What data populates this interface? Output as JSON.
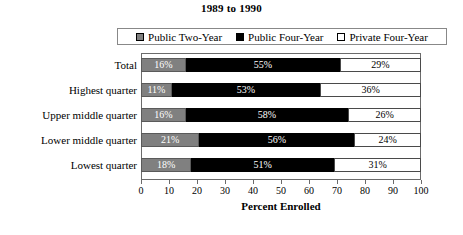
{
  "chart_data": {
    "type": "bar",
    "orientation": "horizontal",
    "stacked": true,
    "title": "1989 to 1990",
    "xlabel": "Percent Enrolled",
    "ylabel": "",
    "xlim": [
      0,
      100
    ],
    "xticks": [
      0,
      10,
      20,
      30,
      40,
      50,
      60,
      70,
      80,
      90,
      100
    ],
    "grid": false,
    "legend_position": "top",
    "categories": [
      "Total",
      "Highest quarter",
      "Upper middle quarter",
      "Lower middle quarter",
      "Lowest quarter"
    ],
    "series": [
      {
        "name": "Public Two-Year",
        "color": "#808080",
        "values": [
          16,
          11,
          16,
          21,
          18
        ],
        "labels": [
          "16%",
          "11%",
          "16%",
          "21%",
          "18%"
        ]
      },
      {
        "name": "Public Four-Year",
        "color": "#000000",
        "values": [
          55,
          53,
          58,
          56,
          51
        ],
        "labels": [
          "55%",
          "53%",
          "58%",
          "56%",
          "51%"
        ]
      },
      {
        "name": "Private Four-Year",
        "color": "#ffffff",
        "values": [
          29,
          36,
          26,
          24,
          31
        ],
        "labels": [
          "29%",
          "36%",
          "26%",
          "24%",
          "31%"
        ]
      }
    ]
  },
  "legend": {
    "entries": [
      {
        "label": "Public Two-Year"
      },
      {
        "label": "Public Four-Year"
      },
      {
        "label": "Private Four-Year"
      }
    ]
  }
}
